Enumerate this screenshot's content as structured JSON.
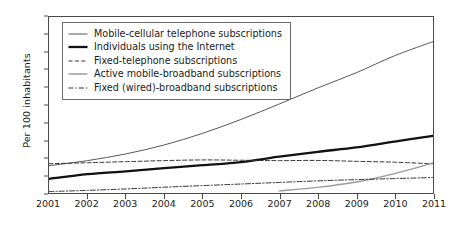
{
  "chart_data": {
    "type": "line",
    "title": "",
    "xlabel": "",
    "ylabel": "Per 100 inhabitants",
    "xlim": [
      2001,
      2011
    ],
    "ylim": [
      0,
      100
    ],
    "ytick_step": 10,
    "grid": false,
    "legend_position": "top-left",
    "x": [
      2001,
      2002,
      2003,
      2004,
      2005,
      2006,
      2007,
      2008,
      2009,
      2010,
      2011
    ],
    "xticklabels": [
      "2001",
      "2002",
      "2003",
      "2004",
      "2005",
      "2006",
      "2007",
      "2008",
      "2009",
      "2010",
      "2011"
    ],
    "yticklabels": [
      "0",
      "10",
      "20",
      "30",
      "40",
      "50",
      "60",
      "70",
      "80",
      "90",
      "100"
    ],
    "series": [
      {
        "name": "Mobile-cellular telephone subscriptions",
        "style": "thin-solid",
        "color": "#555555",
        "values": [
          15.5,
          18.4,
          22.2,
          27.3,
          33.9,
          41.8,
          50.6,
          59.7,
          68.3,
          78.0,
          86.0
        ]
      },
      {
        "name": "Individuals using the Internet",
        "style": "thick-solid",
        "color": "#111111",
        "values": [
          8.0,
          10.7,
          12.3,
          14.1,
          15.8,
          17.6,
          20.6,
          23.4,
          25.9,
          29.2,
          32.5
        ]
      },
      {
        "name": "Fixed-telephone subscriptions",
        "style": "dashed",
        "color": "#333333",
        "values": [
          16.6,
          17.2,
          17.8,
          18.4,
          18.8,
          18.6,
          18.4,
          18.5,
          18.0,
          17.5,
          16.6
        ]
      },
      {
        "name": "Active mobile-broadband subscriptions",
        "style": "gray-solid",
        "color": "#9a9a9a",
        "values": [
          null,
          null,
          null,
          null,
          null,
          null,
          1.2,
          3.2,
          6.2,
          11.0,
          17.0
        ]
      },
      {
        "name": "Fixed (wired)-broadband subscriptions",
        "style": "dash-dot",
        "color": "#333333",
        "values": [
          0.8,
          1.5,
          2.3,
          3.3,
          4.2,
          5.1,
          6.0,
          6.9,
          7.6,
          8.2,
          8.8
        ]
      }
    ]
  }
}
